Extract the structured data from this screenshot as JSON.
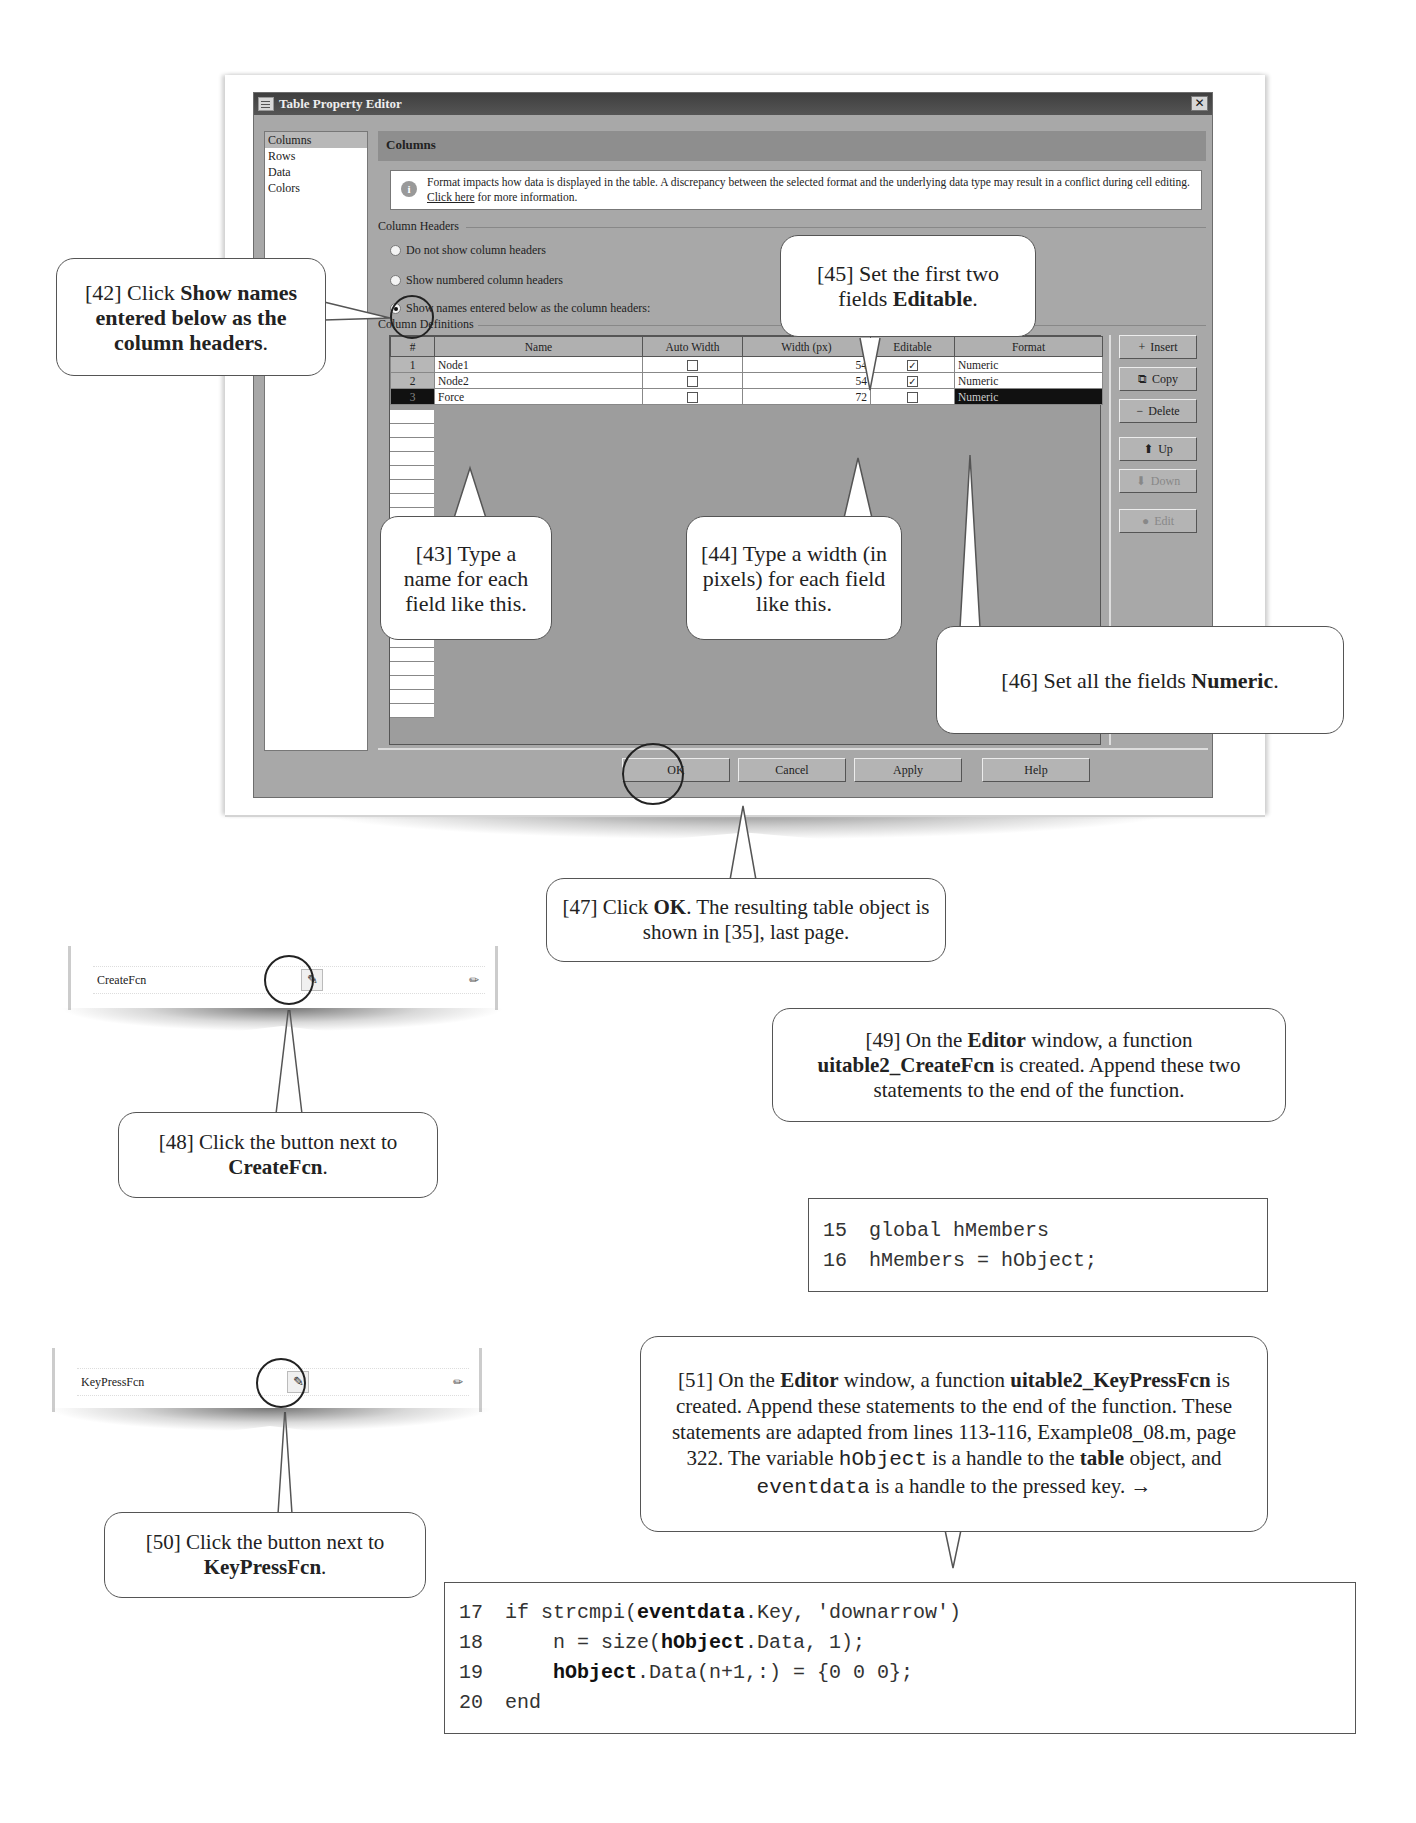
{
  "dialog": {
    "title": "Table Property Editor",
    "close_glyph": "✕",
    "nav": [
      {
        "label": "Columns",
        "selected": true
      },
      {
        "label": "Rows",
        "selected": false
      },
      {
        "label": "Data",
        "selected": false
      },
      {
        "label": "Colors",
        "selected": false
      }
    ],
    "section_title": "Columns",
    "info": {
      "icon": "i",
      "text_before": "Format impacts how data is displayed in the table. A discrepancy between the selected format and the underlying data type may result in a conflict during cell editing. ",
      "link": "Click here",
      "text_after": " for more information."
    },
    "column_headers_group": "Column Headers",
    "radio_options": [
      {
        "label": "Do not show column headers",
        "checked": false
      },
      {
        "label": "Show numbered column headers",
        "checked": false
      },
      {
        "label": "Show names entered below as the column headers:",
        "checked": true
      }
    ],
    "column_definitions_group": "Column Definitions",
    "table": {
      "headers": [
        "#",
        "Name",
        "Auto Width",
        "Width (px)",
        "Editable",
        "Format"
      ],
      "rows": [
        {
          "num": "1",
          "name": "Node1",
          "auto_width": false,
          "width": "54",
          "editable": true,
          "format": "Numeric",
          "selected": false
        },
        {
          "num": "2",
          "name": "Node2",
          "auto_width": false,
          "width": "54",
          "editable": true,
          "format": "Numeric",
          "selected": false
        },
        {
          "num": "3",
          "name": "Force",
          "auto_width": false,
          "width": "72",
          "editable": false,
          "format": "Numeric",
          "selected": true
        }
      ]
    },
    "side_buttons": {
      "insert": "Insert",
      "copy": "Copy",
      "delete": "Delete",
      "up": "Up",
      "down": "Down",
      "edit": "Edit"
    },
    "bottom_buttons": {
      "ok": "OK",
      "cancel": "Cancel",
      "apply": "Apply",
      "help": "Help"
    }
  },
  "callouts": {
    "c42": {
      "prefix": "[42] Click ",
      "bold": "Show names entered below as the column headers",
      "suffix": "."
    },
    "c43": {
      "text": "[43] Type a name for each field like this."
    },
    "c44": {
      "text": "[44] Type a width (in pixels) for each field like this."
    },
    "c45": {
      "prefix": "[45] Set the first two fields ",
      "bold": "Editable",
      "suffix": "."
    },
    "c46": {
      "prefix": "[46] Set all the fields ",
      "bold": "Numeric",
      "suffix": "."
    },
    "c47": {
      "prefix": "[47] Click ",
      "bold": "OK",
      "suffix": ".  The resulting table object is shown in [35], last page."
    },
    "c48": {
      "prefix": "[48] Click the button next to ",
      "bold": "CreateFcn",
      "suffix": "."
    },
    "c49": {
      "p1": "[49] On the ",
      "b1": "Editor",
      "p2": " window, a function ",
      "b2": "uitable2_CreateFcn",
      "p3": " is created.  Append these two statements to the end of the function."
    },
    "c50": {
      "prefix": "[50] Click the button next to ",
      "bold": "KeyPressFcn",
      "suffix": "."
    },
    "c51": {
      "p1": "[51] On the ",
      "b1": "Editor",
      "p2": " window, a function ",
      "b2": "uitable2_KeyPressFcn",
      "p3": " is created.  Append these statements to the end of the function.  These statements are adapted from lines 113-116, Example08_08.m, page 322. The variable ",
      "m1": "hObject",
      "p4": " is a handle to the ",
      "b3": "table",
      "p5": " object, and ",
      "m2": "eventdata",
      "p6": " is a handle to the pressed key.  →"
    }
  },
  "property_rows": {
    "create": {
      "label": "CreateFcn"
    },
    "keypress": {
      "label": "KeyPressFcn"
    }
  },
  "code1": [
    {
      "ln": "15",
      "code": "global hMembers"
    },
    {
      "ln": "16",
      "code": "hMembers = hObject;"
    }
  ],
  "code2": [
    {
      "ln": "17",
      "a": "if strcmpi(",
      "b": "eventdata",
      "c": ".Key, 'downarrow')"
    },
    {
      "ln": "18",
      "a": "    n = size(",
      "b": "hObject",
      "c": ".Data, 1);"
    },
    {
      "ln": "19",
      "a": "    ",
      "b": "hObject",
      "c": ".Data(n+1,:) = {0 0 0};"
    },
    {
      "ln": "20",
      "a": "end",
      "b": "",
      "c": ""
    }
  ]
}
